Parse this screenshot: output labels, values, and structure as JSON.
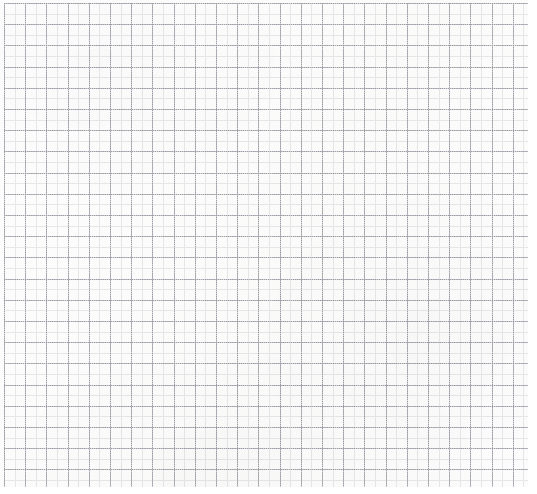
{
  "document": {
    "kind": "graph-paper-sheet",
    "title": "Blank graph paper",
    "description": "A blank sheet of dotted grid / graph paper with no written content.",
    "width_px": 537,
    "height_px": 494,
    "background_color": "#fdfdfd",
    "page_margin_color": "#ffffff"
  },
  "grid": {
    "origin_x_px": 4,
    "origin_y_px": 3,
    "area_width_px": 524,
    "area_height_px": 484,
    "major": {
      "label": "Major gridlines",
      "spacing_px": 21.2,
      "color": "#9d9da6",
      "style": "dotted",
      "thickness_px": 1,
      "column_count": 25,
      "row_count": 23
    },
    "minor": {
      "label": "Minor gridlines",
      "spacing_px": 10.6,
      "color": "#dcdce1",
      "style": "dotted",
      "thickness_px": 1,
      "subdivisions_per_major": 2
    },
    "margins": {
      "right_px": 9,
      "bottom_px": 7
    }
  },
  "content": {
    "text_items": [],
    "annotations": [],
    "has_handwriting": false,
    "has_drawings": false
  }
}
